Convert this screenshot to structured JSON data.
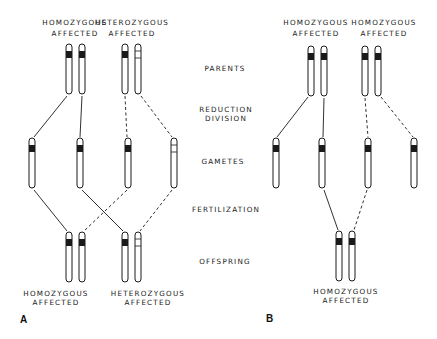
{
  "figure": {
    "stages": [
      "PARENTS",
      "REDUCTION",
      "DIVISION",
      "GAMETES",
      "FERTILIZATION",
      "OFFSPRING"
    ],
    "panel_a": {
      "letter": "A",
      "parent_left": [
        "HOMOZYGOUS",
        "AFFECTED"
      ],
      "parent_right": [
        "HETEROZYGOUS",
        "AFFECTED"
      ],
      "offspring_left": [
        "HOMOZYGOUS",
        "AFFECTED"
      ],
      "offspring_right": [
        "HETEROZYGOUS",
        "AFFECTED"
      ]
    },
    "panel_b": {
      "letter": "B",
      "parent_left": [
        "HOMOZYGOUS",
        "AFFECTED"
      ],
      "parent_right": [
        "HOMOZYGOUS",
        "AFFECTED"
      ],
      "offspring": [
        "HOMOZYGOUS",
        "AFFECTED"
      ]
    },
    "legend": {
      "solid_band": "affected allele",
      "open_band": "normal allele",
      "solid_line": "inheritance from left parent",
      "dashed_line": "inheritance from right parent"
    },
    "colors": {
      "ink": "#1a1a1a",
      "background": "#ffffff"
    }
  }
}
